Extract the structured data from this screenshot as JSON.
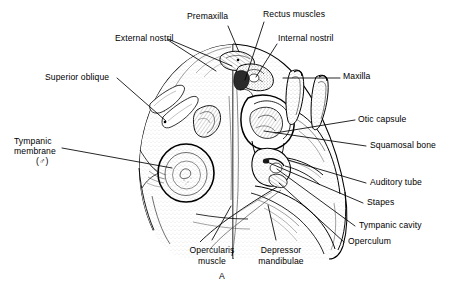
{
  "figure": {
    "caption": "A",
    "background_color": "#ffffff",
    "ink_color": "#000000"
  },
  "labels": [
    {
      "id": "premaxilla",
      "text": "Premaxilla",
      "align": "left"
    },
    {
      "id": "rectus-muscles",
      "text": "Rectus muscles",
      "align": "left"
    },
    {
      "id": "external-nostril",
      "text": "External nostril",
      "align": "left"
    },
    {
      "id": "internal-nostril",
      "text": "Internal nostril",
      "align": "left"
    },
    {
      "id": "superior-oblique",
      "text": "Superior oblique",
      "align": "left"
    },
    {
      "id": "maxilla",
      "text": "Maxilla",
      "align": "left"
    },
    {
      "id": "tympanic-membrane",
      "text": "Tympanic",
      "align": "left"
    },
    {
      "id": "tympanic-membrane-line2",
      "text": "membrane",
      "align": "left"
    },
    {
      "id": "tympanic-membrane-sex",
      "text": "(♂)",
      "align": "left"
    },
    {
      "id": "otic-capsule",
      "text": "Otic capsule",
      "align": "left"
    },
    {
      "id": "squamosal-bone",
      "text": "Squamosal bone",
      "align": "left"
    },
    {
      "id": "auditory-tube",
      "text": "Auditory tube",
      "align": "left"
    },
    {
      "id": "stapes",
      "text": "Stapes",
      "align": "left"
    },
    {
      "id": "tympanic-cavity",
      "text": "Tympanic cavity",
      "align": "left"
    },
    {
      "id": "operculum",
      "text": "Operculum",
      "align": "left"
    },
    {
      "id": "opercularis-muscle",
      "text": "Opercularis",
      "align": "center"
    },
    {
      "id": "opercularis-muscle-line2",
      "text": "muscle",
      "align": "center"
    },
    {
      "id": "depressor-mandibulae",
      "text": "Depressor",
      "align": "center"
    },
    {
      "id": "depressor-mandibulae-line2",
      "text": "mandibulae",
      "align": "center"
    }
  ]
}
